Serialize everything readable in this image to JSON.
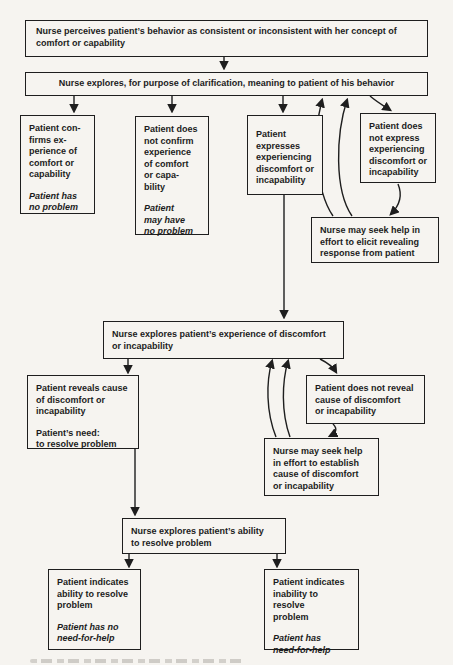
{
  "meta": {
    "kind": "nursing-process flowchart (book scan)",
    "ink_color": "#1e1e1e",
    "paper_color": "#f6f4f0"
  },
  "nodes": {
    "perceive": {
      "text": "Nurse perceives patient’s behavior as consistent or inconsistent with her concept of comfort or capability"
    },
    "clarify": {
      "text": "Nurse explores, for purpose of clarification, meaning to patient of his behavior"
    },
    "confirms": {
      "text": "Patient con-\nfirms ex-\nperience of\ncomfort or\ncapability",
      "note": "Patient has\nno problem"
    },
    "not_confirm": {
      "text": "Patient does\nnot confirm\nexperience\nof comfort\nor capa-\nbility",
      "note": "Patient\nmay have\nno problem"
    },
    "expresses": {
      "text": "Patient\nexpresses\nexperiencing\ndiscomfort or\nincapability"
    },
    "not_express": {
      "text": "Patient does\nnot express\nexperiencing\ndiscomfort or\nincapability"
    },
    "seek_elicit": {
      "text": "Nurse may seek help in\neffort to elicit revealing\nresponse from patient"
    },
    "explore_discomfort": {
      "text": "Nurse explores patient’s experience of discomfort\nor incapability"
    },
    "reveals": {
      "text": "Patient reveals cause\nof discomfort or\nincapability",
      "need": "Patient’s need:\nto resolve problem"
    },
    "not_reveal": {
      "text": "Patient does not reveal\ncause of discomfort\nor incapability"
    },
    "seek_establish": {
      "text": "Nurse may seek help\nin effort to establish\ncause of discomfort\nor incapability"
    },
    "explore_ability": {
      "text": "Nurse explores patient’s ability\nto resolve problem"
    },
    "ability": {
      "text": "Patient indicates\nability to resolve\nproblem",
      "note": "Patient has no\nneed-for-help"
    },
    "inability": {
      "text": "Patient indicates\ninability to resolve\nproblem",
      "note": "Patient has\nneed-for-help"
    }
  },
  "edges": [
    {
      "from": "perceive",
      "to": "clarify",
      "style": "straight"
    },
    {
      "from": "clarify",
      "to": "confirms",
      "style": "straight"
    },
    {
      "from": "clarify",
      "to": "not_confirm",
      "style": "straight"
    },
    {
      "from": "clarify",
      "to": "expresses",
      "style": "straight"
    },
    {
      "from": "clarify",
      "to": "not_express",
      "style": "curved"
    },
    {
      "from": "not_express",
      "to": "seek_elicit",
      "style": "curved"
    },
    {
      "from": "seek_elicit",
      "to": "clarify",
      "style": "curved-double"
    },
    {
      "from": "expresses",
      "to": "explore_discomfort",
      "style": "straight"
    },
    {
      "from": "explore_discomfort",
      "to": "reveals",
      "style": "straight"
    },
    {
      "from": "explore_discomfort",
      "to": "not_reveal",
      "style": "curved"
    },
    {
      "from": "not_reveal",
      "to": "seek_establish",
      "style": "curved"
    },
    {
      "from": "seek_establish",
      "to": "explore_discomfort",
      "style": "curved-double"
    },
    {
      "from": "reveals",
      "to": "explore_ability",
      "style": "straight"
    },
    {
      "from": "explore_ability",
      "to": "ability",
      "style": "straight"
    },
    {
      "from": "explore_ability",
      "to": "inability",
      "style": "straight"
    }
  ]
}
